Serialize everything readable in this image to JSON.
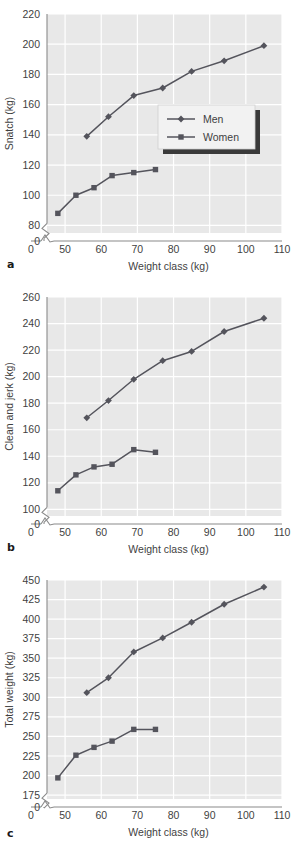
{
  "figure": {
    "panels": [
      {
        "tag": "a",
        "ylabel": "Snatch (kg)",
        "xlabel": "Weight class (kg)",
        "has_legend": true
      },
      {
        "tag": "b",
        "ylabel": "Clean and jerk (kg)",
        "xlabel": "Weight class (kg)",
        "has_legend": false
      },
      {
        "tag": "c",
        "ylabel": "Total weight (kg)",
        "xlabel": "Weight class (kg)",
        "has_legend": false
      }
    ],
    "legend": {
      "entries": [
        {
          "label": "Men",
          "marker": "diamond-marker",
          "color": "#4a4a52"
        },
        {
          "label": "Women",
          "marker": "square-marker",
          "color": "#4a4a52"
        }
      ]
    },
    "colors": {
      "plot_background": "#e8e8e8",
      "gridline": "#ffffff",
      "series_line": "#54545c",
      "axis": "#8a8a8a",
      "text": "#3f3f3f",
      "panel_tag": "#1a1a1a",
      "legend_background": "#f2f2f2",
      "legend_shadow": "#3a3a3a"
    }
  },
  "chart_data": [
    {
      "type": "line",
      "panel": "a",
      "title": "",
      "xlabel": "Weight class (kg)",
      "ylabel": "Snatch (kg)",
      "xlim": [
        45,
        110
      ],
      "ylim": [
        75,
        220
      ],
      "xticks": [
        0,
        50,
        60,
        70,
        80,
        90,
        100,
        110
      ],
      "yticks": [
        0,
        80,
        100,
        120,
        140,
        160,
        180,
        200,
        220
      ],
      "axis_break_x": true,
      "axis_break_y": true,
      "grid": true,
      "legend_position": "inside-right-middle",
      "series": [
        {
          "name": "Men",
          "marker": "diamond",
          "x": [
            56,
            62,
            69,
            77,
            85,
            94,
            105
          ],
          "values": [
            139,
            152,
            166,
            171,
            182,
            189,
            199
          ]
        },
        {
          "name": "Women",
          "marker": "square",
          "x": [
            48,
            53,
            58,
            63,
            69,
            75
          ],
          "values": [
            88,
            100,
            105,
            113,
            115,
            117
          ]
        }
      ]
    },
    {
      "type": "line",
      "panel": "b",
      "title": "",
      "xlabel": "Weight class (kg)",
      "ylabel": "Clean and jerk (kg)",
      "xlim": [
        45,
        110
      ],
      "ylim": [
        95,
        260
      ],
      "xticks": [
        0,
        50,
        60,
        70,
        80,
        90,
        100,
        110
      ],
      "yticks": [
        0,
        100,
        120,
        140,
        160,
        180,
        200,
        220,
        240,
        260
      ],
      "axis_break_x": true,
      "axis_break_y": true,
      "grid": true,
      "legend_position": "none",
      "series": [
        {
          "name": "Men",
          "marker": "diamond",
          "x": [
            56,
            62,
            69,
            77,
            85,
            94,
            105
          ],
          "values": [
            169,
            182,
            198,
            212,
            219,
            234,
            244
          ]
        },
        {
          "name": "Women",
          "marker": "square",
          "x": [
            48,
            53,
            58,
            63,
            69,
            75
          ],
          "values": [
            114,
            126,
            132,
            134,
            145,
            143
          ]
        }
      ]
    },
    {
      "type": "line",
      "panel": "c",
      "title": "",
      "xlabel": "Weight class (kg)",
      "ylabel": "Total weight (kg)",
      "xlim": [
        45,
        110
      ],
      "ylim": [
        170,
        450
      ],
      "xticks": [
        0,
        50,
        60,
        70,
        80,
        90,
        100,
        110
      ],
      "yticks": [
        0,
        175,
        200,
        225,
        250,
        275,
        300,
        325,
        350,
        375,
        400,
        425,
        450
      ],
      "axis_break_x": true,
      "axis_break_y": true,
      "grid": true,
      "legend_position": "none",
      "series": [
        {
          "name": "Men",
          "marker": "diamond",
          "x": [
            56,
            62,
            69,
            77,
            85,
            94,
            105
          ],
          "values": [
            306,
            325,
            358,
            376,
            396,
            419,
            441
          ]
        },
        {
          "name": "Women",
          "marker": "square",
          "x": [
            48,
            53,
            58,
            63,
            69,
            75
          ],
          "values": [
            197,
            226,
            236,
            244,
            259,
            259
          ]
        }
      ]
    }
  ]
}
